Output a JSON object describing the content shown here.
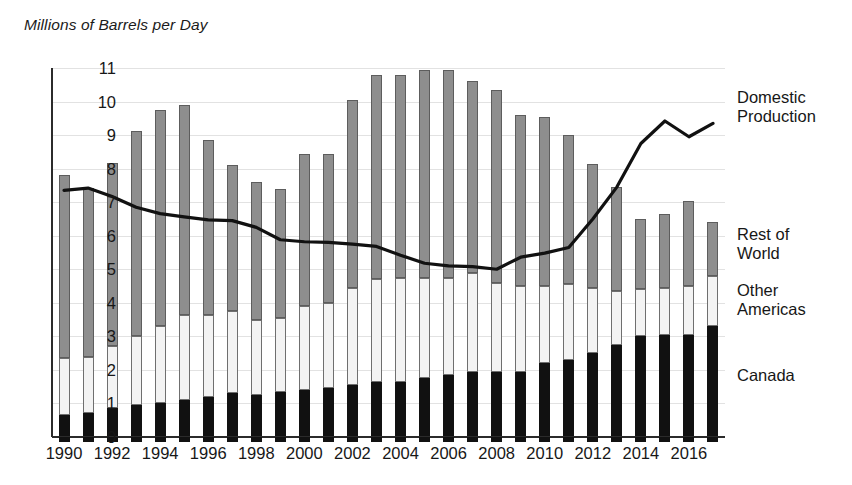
{
  "chart_data": {
    "type": "bar",
    "variant": "stacked-bar-with-line",
    "title": "",
    "ylabel": "Millions of Barrels per Day",
    "xlabel": "",
    "ylim": [
      0,
      11
    ],
    "ytick_values": [
      0,
      1,
      2,
      3,
      4,
      5,
      6,
      7,
      8,
      9,
      10,
      11
    ],
    "ytick_labels": [
      "0",
      "1",
      "2",
      "3",
      "4",
      "5",
      "6",
      "7",
      "8",
      "9",
      "10",
      "11"
    ],
    "grid": true,
    "legend_position": "right",
    "categories": [
      1990,
      1991,
      1992,
      1993,
      1994,
      1995,
      1996,
      1997,
      1998,
      1999,
      2000,
      2001,
      2002,
      2003,
      2004,
      2005,
      2006,
      2007,
      2008,
      2009,
      2010,
      2011,
      2012,
      2013,
      2014,
      2015,
      2016,
      2017
    ],
    "xtick_labels": [
      "1990",
      "1992",
      "1994",
      "1996",
      "1998",
      "2000",
      "2002",
      "2004",
      "2006",
      "2008",
      "2010",
      "2012",
      "2014",
      "2016"
    ],
    "xtick_values": [
      1990,
      1992,
      1994,
      1996,
      1998,
      2000,
      2002,
      2004,
      2006,
      2008,
      2010,
      2012,
      2014,
      2016
    ],
    "series": [
      {
        "name": "Canada",
        "kind": "bar-segment",
        "color": "#111111",
        "values": [
          0.65,
          0.73,
          0.86,
          0.96,
          1.0,
          1.1,
          1.2,
          1.3,
          1.25,
          1.35,
          1.4,
          1.45,
          1.55,
          1.65,
          1.65,
          1.75,
          1.85,
          1.95,
          1.95,
          1.95,
          2.2,
          2.3,
          2.5,
          2.75,
          3.0,
          3.05,
          3.05,
          3.3
        ]
      },
      {
        "name": "Other Americas",
        "kind": "bar-segment",
        "color": "#f3f3f3",
        "values": [
          1.7,
          1.65,
          1.85,
          2.05,
          2.3,
          2.55,
          2.45,
          2.45,
          2.25,
          2.2,
          2.5,
          2.55,
          2.9,
          3.05,
          3.1,
          3.0,
          2.9,
          2.95,
          2.65,
          2.55,
          2.3,
          2.25,
          1.95,
          1.6,
          1.4,
          1.4,
          1.45,
          1.5
        ]
      },
      {
        "name": "Rest of World",
        "kind": "bar-segment",
        "color": "#8e8e8e",
        "values": [
          5.45,
          5.05,
          5.45,
          6.1,
          6.45,
          6.25,
          5.2,
          4.35,
          4.1,
          3.85,
          4.55,
          4.45,
          5.6,
          6.1,
          6.05,
          6.2,
          6.2,
          5.7,
          5.75,
          5.1,
          5.05,
          4.45,
          3.7,
          3.1,
          2.1,
          2.2,
          2.55,
          1.6
        ]
      }
    ],
    "line_series": {
      "name": "Domestic Production",
      "kind": "line",
      "color": "#111111",
      "x": [
        1990,
        1991,
        1992,
        1993,
        1994,
        1995,
        1996,
        1997,
        1998,
        1999,
        2000,
        2001,
        2002,
        2003,
        2004,
        2005,
        2006,
        2007,
        2008,
        2009,
        2010,
        2011,
        2012,
        2013,
        2014,
        2015,
        2016,
        2017
      ],
      "values": [
        7.35,
        7.42,
        7.17,
        6.85,
        6.66,
        6.56,
        6.47,
        6.45,
        6.25,
        5.88,
        5.82,
        5.8,
        5.75,
        5.68,
        5.42,
        5.18,
        5.1,
        5.08,
        5.0,
        5.36,
        5.48,
        5.65,
        6.5,
        7.45,
        8.75,
        9.42,
        8.95,
        9.35
      ]
    }
  },
  "legend": {
    "domestic": "Domestic\nProduction",
    "rest_of_world": "Rest of\nWorld",
    "other_americas": "Other\nAmericas",
    "canada": "Canada"
  }
}
